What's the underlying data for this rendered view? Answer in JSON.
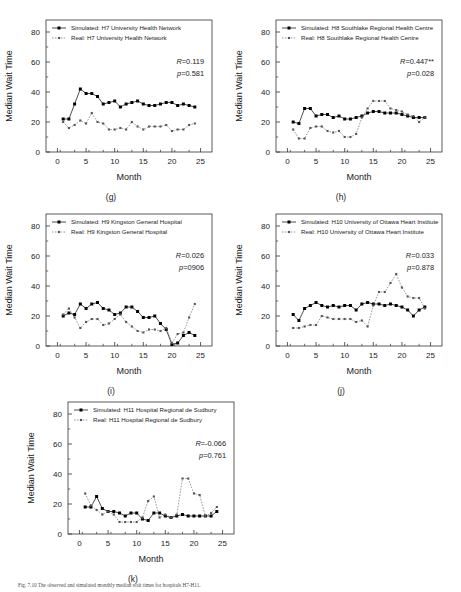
{
  "figure": {
    "caption": "Fig. 7.10  The observed and simulated monthly median wait times for hospitals H7-H11."
  },
  "axes": {
    "xlabel": "Month",
    "ylabel": "Median Wait Time",
    "xticks": [
      "0",
      "5",
      "10",
      "15",
      "20",
      "25"
    ],
    "yticks": [
      "0",
      "20",
      "40",
      "60",
      "80"
    ],
    "xlim": [
      -2,
      27
    ],
    "ylim": [
      0,
      88
    ]
  },
  "chart_data": [
    {
      "type": "line",
      "panel": "g",
      "label": "(g)",
      "title": "",
      "xlabel": "Month",
      "ylabel": "Median Wait Time",
      "xlim": [
        -2,
        27
      ],
      "ylim": [
        0,
        88
      ],
      "xticks": [
        0,
        5,
        10,
        15,
        20,
        25
      ],
      "yticks": [
        0,
        20,
        40,
        60,
        80
      ],
      "grid": false,
      "legend_position": "top-left",
      "annotations": {
        "R": "R=0.119",
        "p": "p=0.581"
      },
      "x": [
        1,
        2,
        3,
        4,
        5,
        6,
        7,
        8,
        9,
        10,
        11,
        12,
        13,
        14,
        15,
        16,
        17,
        18,
        19,
        20,
        21,
        22,
        23,
        24
      ],
      "series": [
        {
          "name": "Simulated: H7 University Health Network",
          "marker": "filled-square",
          "line": "solid",
          "color": "#000000",
          "values": [
            22,
            22,
            32,
            42,
            39,
            39,
            37,
            32,
            33,
            34,
            30,
            32,
            33,
            34,
            32,
            31,
            31,
            32,
            33,
            33,
            31,
            32,
            31,
            30
          ]
        },
        {
          "name": "Real: H7 University Health Network",
          "marker": "small-square",
          "line": "dotted",
          "color": "#555555",
          "values": [
            20,
            16,
            18,
            21,
            19,
            26,
            20,
            19,
            15,
            15,
            16,
            15,
            20,
            17,
            15,
            17,
            17,
            17,
            18,
            14,
            15,
            15,
            18,
            19
          ]
        }
      ]
    },
    {
      "type": "line",
      "panel": "h",
      "label": "(h)",
      "title": "",
      "xlabel": "Month",
      "ylabel": "Median Wait Time",
      "xlim": [
        -2,
        27
      ],
      "ylim": [
        0,
        88
      ],
      "xticks": [
        0,
        5,
        10,
        15,
        20,
        25
      ],
      "yticks": [
        0,
        20,
        40,
        60,
        80
      ],
      "grid": false,
      "legend_position": "top-left",
      "annotations": {
        "R": "R=0.447**",
        "p": "p=0.028"
      },
      "x": [
        1,
        2,
        3,
        4,
        5,
        6,
        7,
        8,
        9,
        10,
        11,
        12,
        13,
        14,
        15,
        16,
        17,
        18,
        19,
        20,
        21,
        22,
        23,
        24
      ],
      "series": [
        {
          "name": "Simulated: H8 Southlake Regional Health Centre",
          "marker": "filled-square",
          "line": "solid",
          "color": "#000000",
          "values": [
            20,
            19,
            29,
            29,
            24,
            25,
            25,
            23,
            24,
            22,
            22,
            23,
            24,
            26,
            27,
            27,
            26,
            26,
            26,
            25,
            24,
            23,
            23,
            23
          ]
        },
        {
          "name": "Real: H8 Southlake Regional Health Centre",
          "marker": "small-square",
          "line": "dotted",
          "color": "#555555",
          "values": [
            15,
            9,
            9,
            16,
            17,
            17,
            14,
            13,
            14,
            10,
            10,
            12,
            23,
            29,
            34,
            34,
            34,
            29,
            28,
            27,
            25,
            24,
            20,
            23
          ]
        }
      ]
    },
    {
      "type": "line",
      "panel": "i",
      "label": "(i)",
      "title": "",
      "xlabel": "Month",
      "ylabel": "Median Wait Time",
      "xlim": [
        -2,
        27
      ],
      "ylim": [
        0,
        88
      ],
      "xticks": [
        0,
        5,
        10,
        15,
        20,
        25
      ],
      "yticks": [
        0,
        20,
        40,
        60,
        80
      ],
      "grid": false,
      "legend_position": "top-left",
      "annotations": {
        "R": "R=0.026",
        "p": "p=0906"
      },
      "x": [
        1,
        2,
        3,
        4,
        5,
        6,
        7,
        8,
        9,
        10,
        11,
        12,
        13,
        14,
        15,
        16,
        17,
        18,
        19,
        20,
        21,
        22,
        23,
        24
      ],
      "series": [
        {
          "name": "Simulated: H9 Kingston General Hospital",
          "marker": "filled-square",
          "line": "solid",
          "color": "#000000",
          "values": [
            20,
            22,
            21,
            28,
            25,
            28,
            29,
            25,
            24,
            21,
            22,
            26,
            26,
            23,
            19,
            19,
            20,
            15,
            11,
            1,
            2,
            7,
            9,
            7
          ]
        },
        {
          "name": "Real: H9 Kingston General Hospital",
          "marker": "small-square",
          "line": "dotted",
          "color": "#555555",
          "values": [
            21,
            25,
            19,
            12,
            16,
            18,
            18,
            14,
            15,
            18,
            21,
            16,
            13,
            10,
            9,
            11,
            11,
            10,
            12,
            2,
            8,
            9,
            19,
            28
          ]
        }
      ]
    },
    {
      "type": "line",
      "panel": "j",
      "label": "(j)",
      "title": "",
      "xlabel": "Month",
      "ylabel": "Median Wait Time",
      "xlim": [
        -2,
        27
      ],
      "ylim": [
        0,
        88
      ],
      "xticks": [
        0,
        5,
        10,
        15,
        20,
        25
      ],
      "yticks": [
        0,
        20,
        40,
        60,
        80
      ],
      "grid": false,
      "legend_position": "top-left",
      "annotations": {
        "R": "R=0.033",
        "p": "p=0.878"
      },
      "x": [
        1,
        2,
        3,
        4,
        5,
        6,
        7,
        8,
        9,
        10,
        11,
        12,
        13,
        14,
        15,
        16,
        17,
        18,
        19,
        20,
        21,
        22,
        23,
        24
      ],
      "series": [
        {
          "name": "Simulated: H10 University of Ottawa Heart Institute",
          "marker": "filled-square",
          "line": "solid",
          "color": "#000000",
          "values": [
            21,
            17,
            25,
            27,
            29,
            27,
            26,
            27,
            26,
            27,
            27,
            24,
            28,
            29,
            28,
            28,
            27,
            28,
            27,
            26,
            24,
            20,
            24,
            26
          ]
        },
        {
          "name": "Real: H10 University of Ottawa Heart Institute",
          "marker": "small-square",
          "line": "dotted",
          "color": "#555555",
          "values": [
            12,
            12,
            13,
            14,
            14,
            20,
            19,
            18,
            18,
            18,
            18,
            16,
            17,
            13,
            27,
            36,
            36,
            42,
            48,
            39,
            33,
            32,
            32,
            25
          ]
        }
      ]
    },
    {
      "type": "line",
      "panel": "k",
      "label": "(k)",
      "title": "",
      "xlabel": "Month",
      "ylabel": "Median Wait Time",
      "xlim": [
        -2,
        27
      ],
      "ylim": [
        0,
        88
      ],
      "xticks": [
        0,
        5,
        10,
        15,
        20,
        25
      ],
      "yticks": [
        0,
        20,
        40,
        60,
        80
      ],
      "grid": false,
      "legend_position": "top-left",
      "annotations": {
        "R": "R=-0.066",
        "p": "p=0.761"
      },
      "x": [
        1,
        2,
        3,
        4,
        5,
        6,
        7,
        8,
        9,
        10,
        11,
        12,
        13,
        14,
        15,
        16,
        17,
        18,
        19,
        20,
        21,
        22,
        23,
        24
      ],
      "series": [
        {
          "name": "Simulated: H11 Hospital Regional de Sudbury",
          "marker": "filled-square",
          "line": "solid",
          "color": "#000000",
          "values": [
            18,
            18,
            25,
            17,
            15,
            15,
            14,
            12,
            14,
            14,
            10,
            9,
            14,
            14,
            12,
            11,
            12,
            13,
            12,
            12,
            12,
            12,
            12,
            15
          ]
        },
        {
          "name": "Real: H11 Hospital Regional de Sudbury",
          "marker": "small-square",
          "line": "dotted",
          "color": "#555555",
          "values": [
            27,
            19,
            16,
            13,
            15,
            13,
            8,
            8,
            8,
            8,
            11,
            22,
            25,
            11,
            13,
            11,
            13,
            37,
            37,
            27,
            26,
            12,
            14,
            18
          ]
        }
      ]
    }
  ]
}
